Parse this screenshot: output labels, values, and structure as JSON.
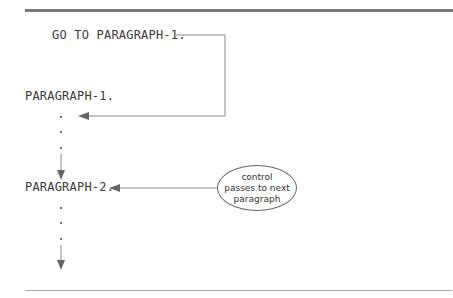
{
  "diagram": {
    "goto_statement": "GO TO PARAGRAPH-1.",
    "paragraph_1": "PARAGRAPH-1.",
    "paragraph_2": "PARAGRAPH-2.",
    "callout": {
      "line1": "control",
      "line2": "passes to next",
      "line3": "paragraph"
    },
    "colors": {
      "line": "#777777",
      "text": "#333333"
    }
  }
}
